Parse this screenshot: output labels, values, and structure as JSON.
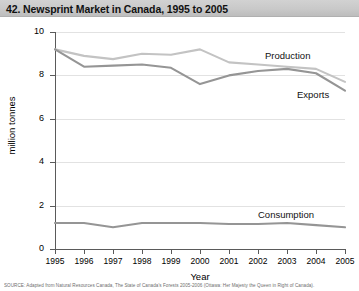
{
  "title": "42. Newsprint Market in Canada, 1995 to 2005",
  "source_note": "SOURCE: Adapted from Natural Resources Canada, The State of Canada's Forests 2005-2006 (Ottawa: Her Majesty the Queen in Right of Canada).",
  "labels": {
    "production": "Production",
    "exports": "Exports",
    "consumption": "Consumption"
  },
  "chart_data": {
    "type": "line",
    "title": "42. Newsprint Market in Canada, 1995 to 2005",
    "xlabel": "Year",
    "ylabel": "million tonnes",
    "categories": [
      "1995",
      "1996",
      "1997",
      "1998",
      "1999",
      "2000",
      "2001",
      "2002",
      "2003",
      "2004",
      "2005"
    ],
    "x": [
      1995,
      1996,
      1997,
      1998,
      1999,
      2000,
      2001,
      2002,
      2003,
      2004,
      2005
    ],
    "xlim": [
      1995,
      2005
    ],
    "ylim": [
      0,
      10
    ],
    "yticks": [
      0,
      2,
      4,
      6,
      8,
      10
    ],
    "ytick_labels": [
      "0",
      "2",
      "4",
      "6",
      "8",
      "10"
    ],
    "grid": true,
    "grid_axis": "y",
    "legend": "inline-labels",
    "series": [
      {
        "name": "Production",
        "color": "#c3c3c3",
        "values": [
          9.2,
          8.9,
          8.75,
          9.0,
          8.95,
          9.2,
          8.6,
          8.5,
          8.4,
          8.3,
          7.7
        ]
      },
      {
        "name": "Exports",
        "color": "#959595",
        "values": [
          9.2,
          8.4,
          8.45,
          8.5,
          8.35,
          7.6,
          8.0,
          8.2,
          8.3,
          8.1,
          7.3
        ]
      },
      {
        "name": "Consumption",
        "color": "#959595",
        "values": [
          1.2,
          1.2,
          1.0,
          1.2,
          1.2,
          1.2,
          1.15,
          1.15,
          1.2,
          1.1,
          1.0
        ]
      }
    ]
  }
}
